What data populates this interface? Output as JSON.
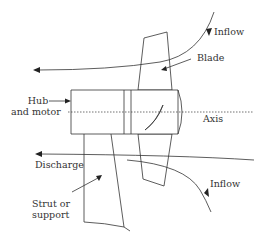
{
  "figure": {
    "type": "schematic",
    "labels": {
      "inflow_top": "Inflow",
      "blade": "Blade",
      "hub_line1": "Hub",
      "hub_line2": "and motor",
      "axis": "Axis",
      "discharge": "Discharge",
      "inflow_bottom": "Inflow",
      "strut_line1": "Strut or",
      "strut_line2": "support"
    },
    "colors": {
      "line": "#333333",
      "text": "#333333",
      "background": "#ffffff"
    }
  }
}
